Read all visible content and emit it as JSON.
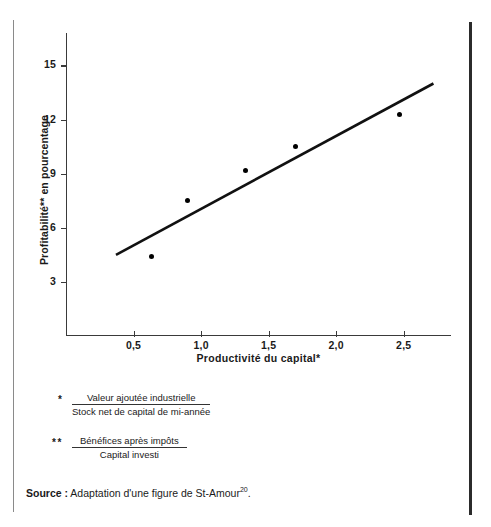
{
  "chart_data": {
    "type": "scatter",
    "title": "",
    "xlabel": "Productivité du capital*",
    "ylabel": "Profitabilité** en pourcentage",
    "xlim": [
      0.0,
      2.85
    ],
    "ylim": [
      0,
      16.8
    ],
    "xticks": [
      "0,5",
      "1,0",
      "1,5",
      "2,0",
      "2,5"
    ],
    "xtick_values": [
      0.5,
      1.0,
      1.5,
      2.0,
      2.5
    ],
    "yticks": [
      "3",
      "6",
      "9",
      "12",
      "15"
    ],
    "ytick_values": [
      3,
      6,
      9,
      12,
      15
    ],
    "grid": false,
    "legend": "none",
    "points": [
      {
        "x": 0.63,
        "y": 4.4
      },
      {
        "x": 0.9,
        "y": 7.5
      },
      {
        "x": 1.33,
        "y": 9.2
      },
      {
        "x": 1.7,
        "y": 10.5
      },
      {
        "x": 2.47,
        "y": 12.3
      }
    ],
    "series": [
      {
        "name": "trend",
        "type": "line",
        "x": [
          0.37,
          2.72
        ],
        "values": [
          4.5,
          14.0
        ]
      }
    ]
  },
  "figure": {
    "xlabel": "Productivité du capital*",
    "ylabel": "Profitabilité** en pourcentage"
  },
  "notes": [
    {
      "mark": "*",
      "numerator": "Valeur ajoutée industrielle",
      "denominator": "Stock net de capital de mi-année"
    },
    {
      "mark": "**",
      "numerator": "Bénéfices après impôts",
      "denominator": "Capital investi"
    }
  ],
  "source": {
    "label": "Source :",
    "text": "Adaptation d'une figure de St-Amour",
    "superscript": "20",
    "period": "."
  },
  "colors": {
    "ink": "#1a1a1a",
    "axis": "#3a3a3a",
    "marker": "#000000",
    "rule_left": "#8a8a8a",
    "rule_right": "#2b2b2b"
  }
}
